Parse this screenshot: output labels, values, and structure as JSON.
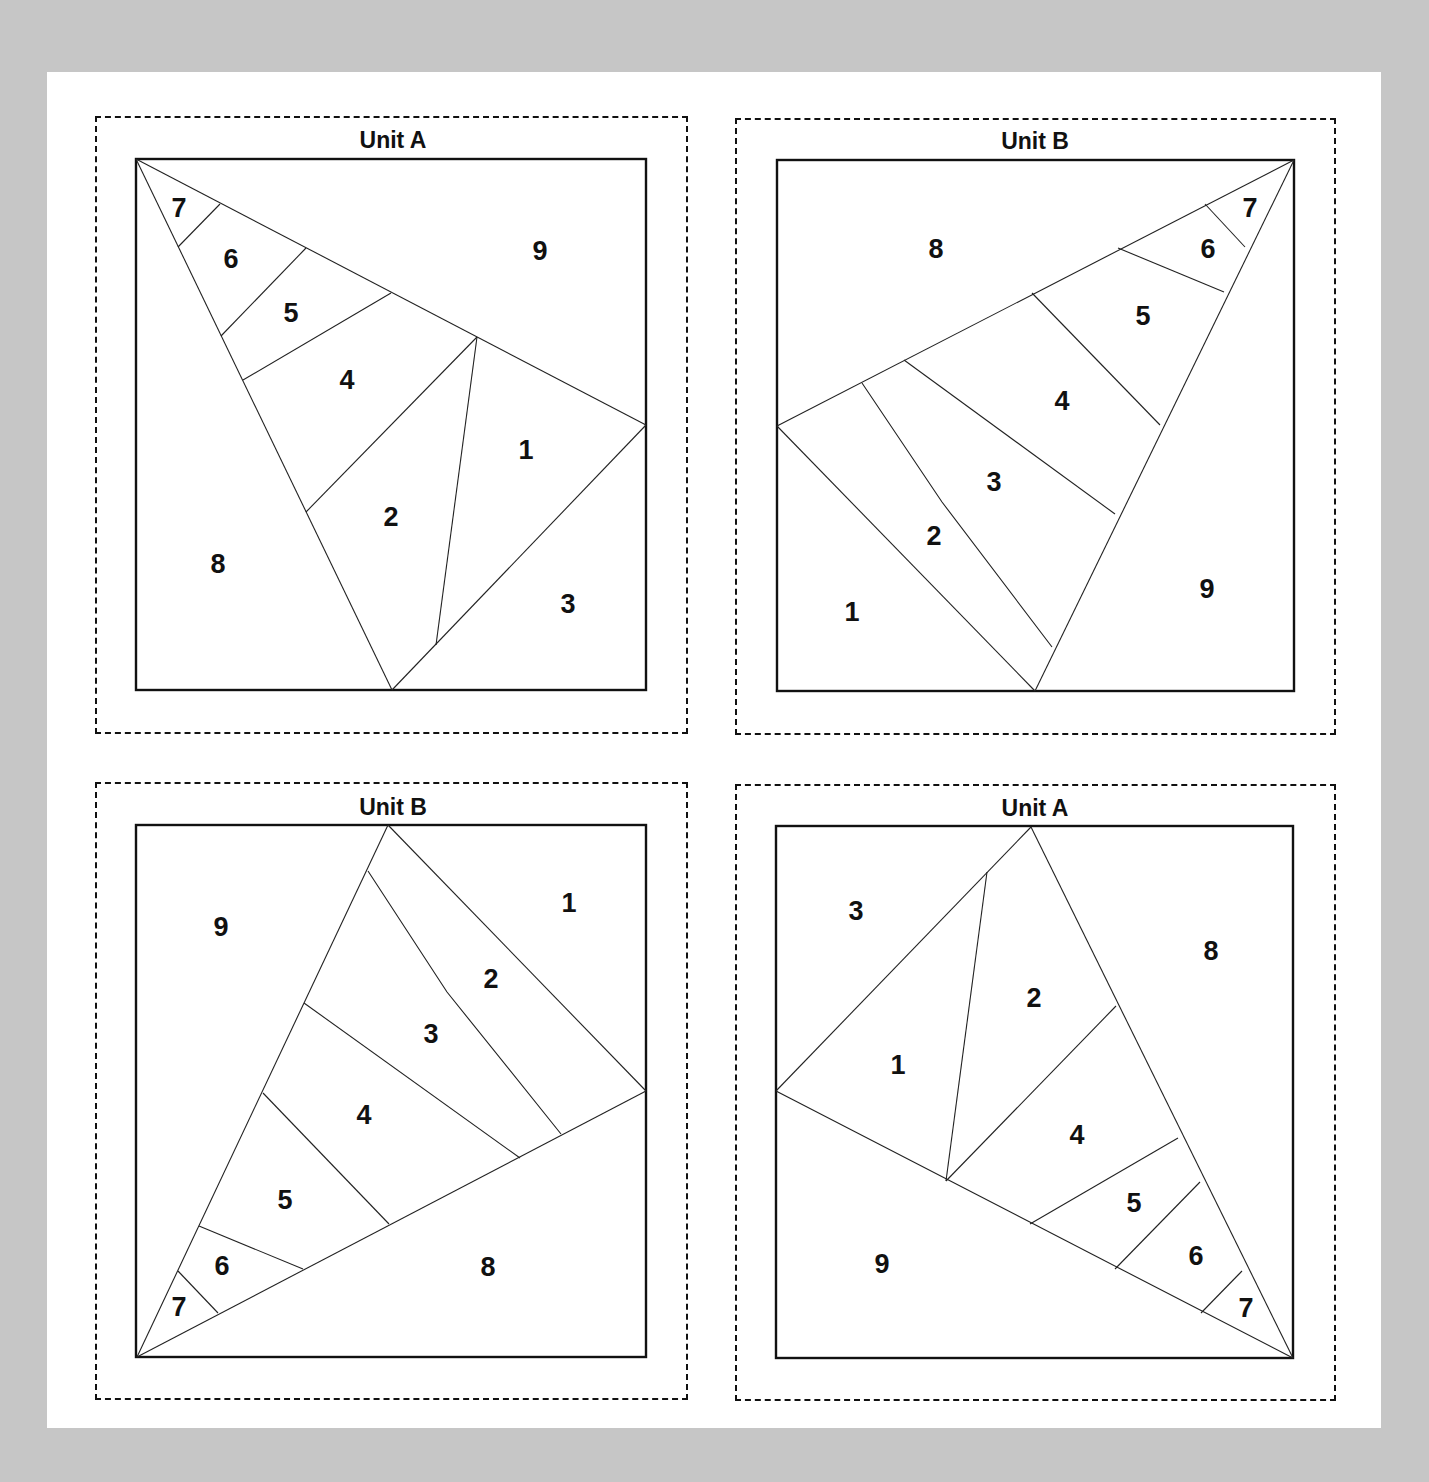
{
  "colors": {
    "background": "#c6c6c6",
    "panel": "#ffffff",
    "line": "#111111"
  },
  "units": [
    {
      "id": "top-left",
      "title": "Unit A",
      "labels": {
        "1": "1",
        "2": "2",
        "3": "3",
        "4": "4",
        "5": "5",
        "6": "6",
        "7": "7",
        "8": "8",
        "9": "9"
      }
    },
    {
      "id": "top-right",
      "title": "Unit B",
      "labels": {
        "1": "1",
        "2": "2",
        "3": "3",
        "4": "4",
        "5": "5",
        "6": "6",
        "7": "7",
        "8": "8",
        "9": "9"
      }
    },
    {
      "id": "bottom-left",
      "title": "Unit B",
      "labels": {
        "1": "1",
        "2": "2",
        "3": "3",
        "4": "4",
        "5": "5",
        "6": "6",
        "7": "7",
        "8": "8",
        "9": "9"
      }
    },
    {
      "id": "bottom-right",
      "title": "Unit A",
      "labels": {
        "1": "1",
        "2": "2",
        "3": "3",
        "4": "4",
        "5": "5",
        "6": "6",
        "7": "7",
        "8": "8",
        "9": "9"
      }
    }
  ]
}
